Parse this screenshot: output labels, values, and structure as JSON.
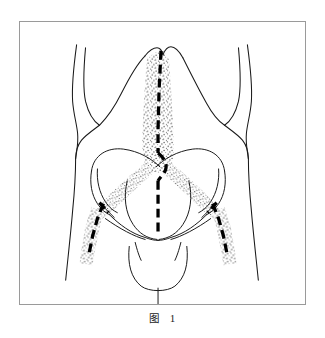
{
  "figure": {
    "caption_label": "图",
    "caption_number": "1",
    "kind": "anatomical-line-drawing",
    "colors": {
      "frame_border": "#9a9a9a",
      "outline_stroke": "#1a1a1a",
      "dash_stroke": "#000000",
      "stipple_fill": "#2b2b2b",
      "background": "#ffffff"
    },
    "elements": {
      "body_outline": "torso-and-arms-contour",
      "pelvis_outline": "iliac-crest-and-pubic-arch",
      "stipple_band_vertical": "midline-stippled-corridor",
      "stipple_band_left_diagonal": "left-iliac-stippled-corridor",
      "stipple_band_right_diagonal": "right-iliac-stippled-corridor",
      "stipple_band_left_lower": "left-inguinal-stippled-corridor",
      "stipple_band_right_lower": "right-inguinal-stippled-corridor",
      "dashed_line_midline": "midline-incision-dashed",
      "dashed_line_left": "left-incision-dashed",
      "dashed_line_right": "right-incision-dashed"
    }
  }
}
